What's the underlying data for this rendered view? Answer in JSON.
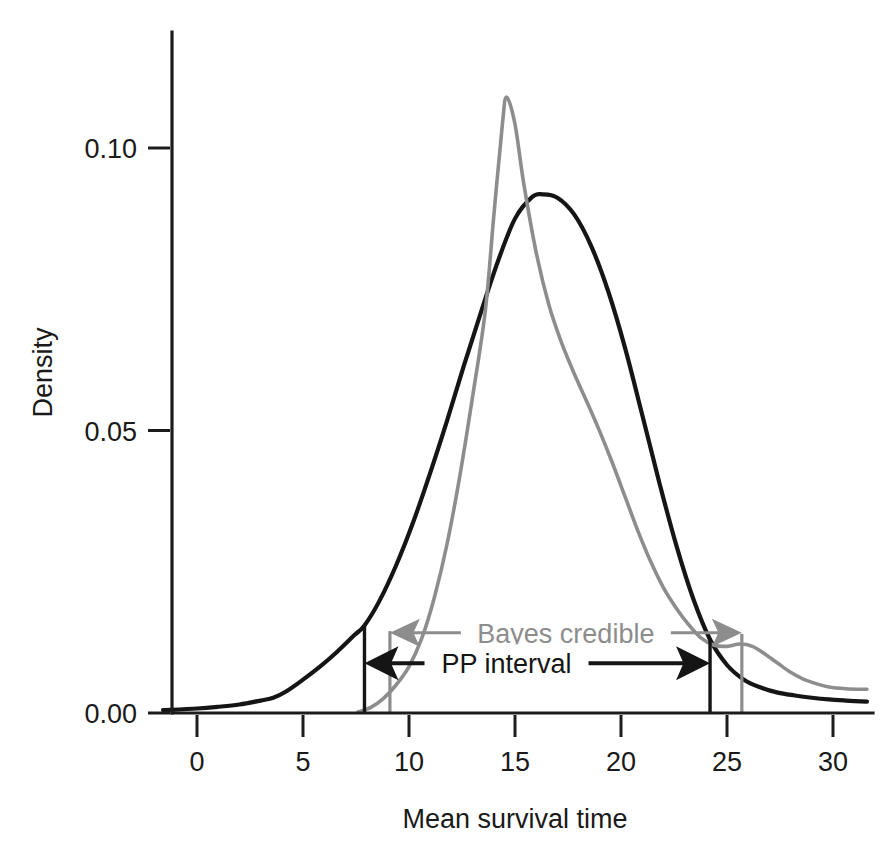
{
  "chart_data": {
    "type": "line",
    "title": "",
    "subtitle": "",
    "xlabel": "Mean survival time",
    "ylabel": "Density",
    "xlim": [
      -1.6,
      31.6
    ],
    "ylim": [
      0.0,
      0.118
    ],
    "xticks": [
      0,
      5,
      10,
      15,
      20,
      25,
      30
    ],
    "xtick_labels": [
      "0",
      "5",
      "10",
      "15",
      "20",
      "25",
      "30"
    ],
    "yticks": [
      0.0,
      0.05,
      0.1
    ],
    "ytick_labels": [
      "0.00",
      "0.05",
      "0.10"
    ],
    "grid": false,
    "legend_position": "none",
    "colors": {
      "posterior_predictive": "#151515",
      "bayes_credible": "#8d8d8d",
      "axis": "#1c1c1c",
      "background": "#ffffff"
    },
    "series": [
      {
        "name": "PP interval density",
        "color": "#151515",
        "x": [
          -1.6,
          0.0,
          1.0,
          2.0,
          3.0,
          3.6,
          4.2,
          5.0,
          5.8,
          6.6,
          7.4,
          7.9,
          8.6,
          9.4,
          10.2,
          11.0,
          11.8,
          12.6,
          13.4,
          14.2,
          15.0,
          15.8,
          16.3,
          17.0,
          17.8,
          18.6,
          19.4,
          20.2,
          21.0,
          21.8,
          22.6,
          23.4,
          24.2,
          25.0,
          25.8,
          26.6,
          27.4,
          28.2,
          29.0,
          29.8,
          30.6,
          31.6
        ],
        "y": [
          0.0005,
          0.0008,
          0.0011,
          0.0015,
          0.0022,
          0.0027,
          0.0038,
          0.0059,
          0.0082,
          0.0108,
          0.0137,
          0.0155,
          0.0198,
          0.0262,
          0.0338,
          0.0425,
          0.0518,
          0.0616,
          0.071,
          0.08,
          0.0875,
          0.0913,
          0.0918,
          0.0912,
          0.0882,
          0.0826,
          0.0746,
          0.0645,
          0.0528,
          0.0409,
          0.0298,
          0.0203,
          0.013,
          0.0085,
          0.0059,
          0.0045,
          0.0036,
          0.0031,
          0.0027,
          0.0024,
          0.0022,
          0.002
        ]
      },
      {
        "name": "Bayes credible density",
        "color": "#8d8d8d",
        "x": [
          7.6,
          8.2,
          8.8,
          9.4,
          10.0,
          10.6,
          11.2,
          11.8,
          12.4,
          13.0,
          13.6,
          14.0,
          14.4,
          14.6,
          15.0,
          15.4,
          16.0,
          16.6,
          17.2,
          17.8,
          18.4,
          19.0,
          19.6,
          20.2,
          20.8,
          21.4,
          22.0,
          22.6,
          23.2,
          23.8,
          24.4,
          25.0,
          25.6,
          26.2,
          26.8,
          27.4,
          28.0,
          28.6,
          29.2,
          29.8,
          30.6,
          31.6
        ],
        "y": [
          0.0002,
          0.001,
          0.0026,
          0.005,
          0.0082,
          0.0132,
          0.0205,
          0.03,
          0.042,
          0.056,
          0.0712,
          0.088,
          0.104,
          0.109,
          0.1042,
          0.094,
          0.0815,
          0.0722,
          0.0655,
          0.06,
          0.055,
          0.0498,
          0.0442,
          0.0382,
          0.0322,
          0.0268,
          0.0222,
          0.0186,
          0.0156,
          0.0132,
          0.012,
          0.0118,
          0.0122,
          0.0118,
          0.0104,
          0.0088,
          0.0072,
          0.006,
          0.0052,
          0.0046,
          0.0043,
          0.0042
        ]
      }
    ],
    "interval_markers": [
      {
        "name": "pp-lower",
        "x": 7.9,
        "y_top": 0.0155,
        "color": "#151515"
      },
      {
        "name": "pp-upper",
        "x": 24.2,
        "y_top": 0.013,
        "color": "#151515"
      },
      {
        "name": "bayes-lower",
        "x": 9.1,
        "y_top": 0.0145,
        "color": "#8d8d8d"
      },
      {
        "name": "bayes-upper",
        "x": 25.7,
        "y_top": 0.014,
        "color": "#8d8d8d"
      }
    ],
    "annotations": [
      {
        "name": "bayes-credible-annotation",
        "label": "Bayes credible",
        "color": "#8d8d8d",
        "x_from": 9.1,
        "x_to": 25.7,
        "y": 0.0142,
        "label_x": 17.4
      },
      {
        "name": "pp-interval-annotation",
        "label": "PP interval",
        "color": "#151515",
        "x_from": 7.9,
        "x_to": 24.2,
        "y": 0.0088,
        "label_x": 14.6
      }
    ]
  }
}
